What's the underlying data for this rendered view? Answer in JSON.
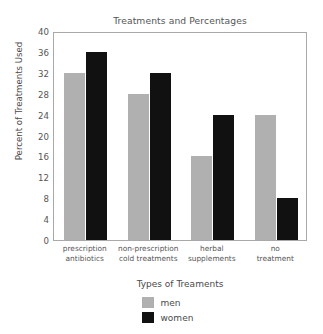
{
  "chart_data": {
    "type": "bar",
    "title": "Treatments and Percentages",
    "xlabel": "Types of Treaments",
    "ylabel": "Percent of Treatments Used",
    "categories": [
      "prescription antibiotics",
      "non-prescription cold treatments",
      "herbal supplements",
      "no treatment"
    ],
    "category_lines": [
      [
        "prescription",
        "antibiotics"
      ],
      [
        "non-prescription",
        "cold treatments"
      ],
      [
        "herbal",
        "supplements"
      ],
      [
        "no",
        "treatment"
      ]
    ],
    "series": [
      {
        "name": "men",
        "color": "#b0b0b0",
        "values": [
          32,
          28,
          16,
          24
        ]
      },
      {
        "name": "women",
        "color": "#111111",
        "values": [
          36,
          32,
          24,
          8
        ]
      }
    ],
    "ylim": [
      0,
      40
    ],
    "yticks": [
      0,
      4,
      8,
      12,
      16,
      20,
      24,
      28,
      32,
      36,
      40
    ],
    "ytick_labels": [
      "0",
      "4",
      "8",
      "12",
      "16",
      "20",
      "24",
      "28",
      "32",
      "36",
      "40"
    ],
    "grid": false,
    "legend_position": "bottom",
    "legend": [
      {
        "label": "men",
        "color": "#b0b0b0"
      },
      {
        "label": "women",
        "color": "#111111"
      }
    ]
  }
}
